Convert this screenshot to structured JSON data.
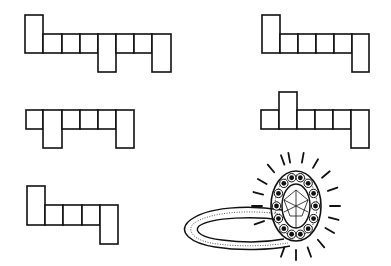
{
  "figure": {
    "ink_color": "#111111",
    "background_color": "#ffffff",
    "nets": [
      {
        "id": "net-a",
        "label": "top-left net",
        "cell_count": 9
      },
      {
        "id": "net-b",
        "label": "top-right net",
        "cell_count": 6
      },
      {
        "id": "net-c",
        "label": "middle-left net",
        "cell_count": 6
      },
      {
        "id": "net-d",
        "label": "middle-right net",
        "cell_count": 6
      },
      {
        "id": "net-e",
        "label": "bottom-left net",
        "cell_count": 5
      }
    ],
    "illustration": {
      "id": "ring",
      "label": "jeweled ring with oval stone",
      "stone_count": 1,
      "surrounding_gems": 14
    }
  }
}
